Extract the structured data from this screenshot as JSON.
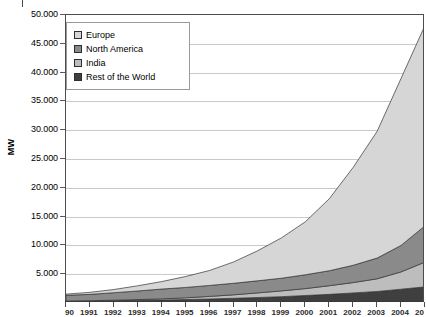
{
  "chart_data": {
    "type": "area",
    "title": "",
    "subtitle": "",
    "xlabel": "",
    "ylabel": "MW",
    "stacked": true,
    "grid": true,
    "legend_position": "top-left",
    "ylim": [
      0,
      50000
    ],
    "ytick_labels": [
      "50.000",
      "45.000",
      "40.000",
      "35.000",
      "30.000",
      "25.000",
      "20.000",
      "15.000",
      "10.000",
      "5.000"
    ],
    "ytick_values": [
      50000,
      45000,
      40000,
      35000,
      30000,
      25000,
      20000,
      15000,
      10000,
      5000
    ],
    "ytick_step": 5000,
    "categories": [
      "1990",
      "1991",
      "1992",
      "1993",
      "1994",
      "1995",
      "1996",
      "1997",
      "1998",
      "1999",
      "2000",
      "2001",
      "2002",
      "2003",
      "2004",
      "2005"
    ],
    "xtick_labels_clipped": true,
    "series": [
      {
        "name": "Europe",
        "color": "#d6d6d6",
        "values": [
          200,
          350,
          550,
          900,
          1300,
          1900,
          2600,
          3700,
          5200,
          7000,
          9200,
          12500,
          17000,
          22000,
          29000,
          34800
        ]
      },
      {
        "name": "North America",
        "color": "#8a8a8a",
        "values": [
          1000,
          1100,
          1300,
          1500,
          1700,
          1800,
          1900,
          2000,
          2100,
          2200,
          2400,
          2600,
          3000,
          3600,
          4600,
          6300
        ]
      },
      {
        "name": "India",
        "color": "#bdbdbd",
        "values": [
          40,
          60,
          90,
          130,
          200,
          300,
          450,
          600,
          800,
          1000,
          1200,
          1500,
          1800,
          2200,
          3000,
          4300
        ]
      },
      {
        "name": "Rest of the World",
        "color": "#3f3f3f",
        "values": [
          300,
          340,
          400,
          460,
          520,
          600,
          700,
          820,
          950,
          1100,
          1300,
          1500,
          1750,
          2000,
          2400,
          2800
        ]
      }
    ],
    "peak_total": 48200
  },
  "legend": {
    "items": [
      {
        "label": "Europe"
      },
      {
        "label": "North America"
      },
      {
        "label": "India"
      },
      {
        "label": "Rest of the World"
      }
    ]
  },
  "axis": {
    "y_title": "MW"
  }
}
